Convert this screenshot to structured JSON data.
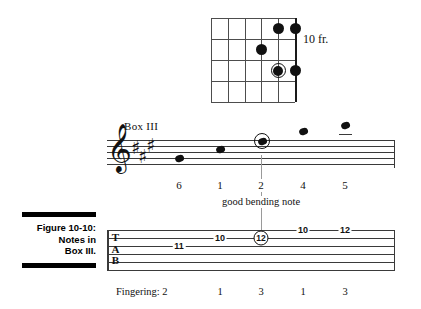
{
  "figure": {
    "caption_lines": [
      "Figure 10-10:",
      "Notes in",
      "Box III."
    ]
  },
  "chord_diagram": {
    "fret_label": "10 fr.",
    "strings": 6,
    "frets": 4,
    "dots": [
      {
        "string": 5,
        "fret": 1,
        "style": "filled"
      },
      {
        "string": 6,
        "fret": 1,
        "style": "filled"
      },
      {
        "string": 4,
        "fret": 2,
        "style": "filled"
      },
      {
        "string": 5,
        "fret": 3,
        "style": "ringed"
      },
      {
        "string": 6,
        "fret": 3,
        "style": "filled"
      }
    ]
  },
  "notation": {
    "box_label": "Box III",
    "clef": "treble-clef",
    "key_signature_sharps": 3,
    "notes": [
      {
        "fingering": "6",
        "ledger": false,
        "ringed": false
      },
      {
        "fingering": "1",
        "ledger": false,
        "ringed": false
      },
      {
        "fingering": "2",
        "ledger": false,
        "ringed": true
      },
      {
        "fingering": "4",
        "ledger": true,
        "ringed": false
      },
      {
        "fingering": "5",
        "ledger": true,
        "ringed": false
      }
    ],
    "bend_note_label": "good bending note"
  },
  "tablature": {
    "letters": [
      "T",
      "A",
      "B"
    ],
    "numbers": [
      {
        "value": "11",
        "circled": false
      },
      {
        "value": "10",
        "circled": false
      },
      {
        "value": "12",
        "circled": true
      },
      {
        "value": "10",
        "circled": false
      },
      {
        "value": "12",
        "circled": false
      }
    ]
  },
  "fingering_row": {
    "label": "Fingering: 2",
    "values": [
      "1",
      "3",
      "1",
      "3"
    ]
  },
  "colors": {
    "ink": "#111111",
    "rule": "#3a3a3a",
    "guide": "#9a9a9a"
  }
}
